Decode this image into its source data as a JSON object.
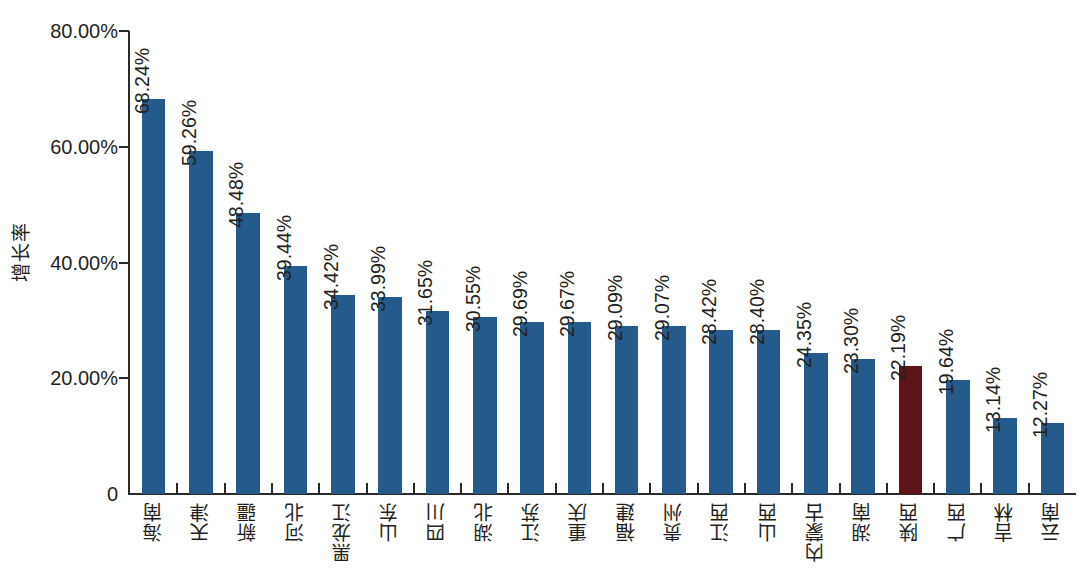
{
  "chart_data": {
    "type": "bar",
    "title": "",
    "subtitle": "",
    "xlabel": "",
    "ylabel": "增长率",
    "ylim": [
      0,
      80
    ],
    "grid": false,
    "legend": null,
    "y_ticks": [
      {
        "value": 80,
        "label": "80.00%"
      },
      {
        "value": 60,
        "label": "60.00%"
      },
      {
        "value": 40,
        "label": "40.00%"
      },
      {
        "value": 20,
        "label": "20.00%"
      },
      {
        "value": 0,
        "label": "0"
      }
    ],
    "categories": [
      "海南",
      "天津",
      "新疆",
      "河北",
      "黑龙江",
      "山东",
      "四川",
      "湖北",
      "江苏",
      "重庆",
      "福建",
      "贵州",
      "江西",
      "山西",
      "内蒙古",
      "湖南",
      "陕西",
      "广西",
      "吉林",
      "云南"
    ],
    "values": [
      68.24,
      59.26,
      48.48,
      39.44,
      34.42,
      33.99,
      31.65,
      30.55,
      29.69,
      29.67,
      29.09,
      29.07,
      28.42,
      28.4,
      24.35,
      23.3,
      22.19,
      19.64,
      13.14,
      12.27
    ],
    "value_labels": [
      "68.24%",
      "59.26%",
      "48.48%",
      "39.44%",
      "34.42%",
      "33.99%",
      "31.65%",
      "30.55%",
      "29.69%",
      "29.67%",
      "29.09%",
      "29.07%",
      "28.42%",
      "28.40%",
      "24.35%",
      "23.30%",
      "22.19%",
      "19.64%",
      "13.14%",
      "12.27%"
    ],
    "highlight_index": 16,
    "colors": {
      "bar": "#255a8c",
      "highlight": "#5d1417",
      "axis": "#2a2a2a",
      "text": "#231f20",
      "background": "#ffffff"
    }
  }
}
